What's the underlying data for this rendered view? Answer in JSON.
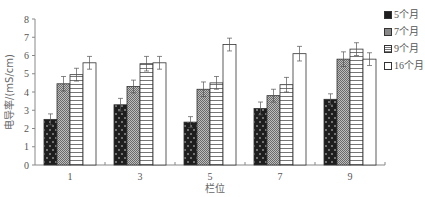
{
  "chart_data": {
    "type": "bar",
    "title": "",
    "xlabel": "栏位",
    "ylabel": "电导率/(mS/cm)",
    "categories": [
      "1",
      "3",
      "5",
      "7",
      "9"
    ],
    "ylim": [
      0,
      8
    ],
    "yticks": [
      0,
      1,
      2,
      3,
      4,
      5,
      6,
      7,
      8
    ],
    "grid": false,
    "legend_position": "top-right",
    "error_bars": true,
    "series": [
      {
        "name": "5个月",
        "pattern": "dark-dotted",
        "values": [
          2.5,
          3.3,
          2.35,
          3.1,
          3.6
        ],
        "errors": [
          0.3,
          0.35,
          0.3,
          0.35,
          0.3
        ]
      },
      {
        "name": "7个月",
        "pattern": "gray-checkered",
        "values": [
          4.45,
          4.3,
          4.15,
          3.8,
          5.8
        ],
        "errors": [
          0.4,
          0.35,
          0.4,
          0.35,
          0.4
        ]
      },
      {
        "name": "9个月",
        "pattern": "horizontal-stripes",
        "values": [
          4.95,
          5.55,
          4.5,
          4.4,
          6.35
        ],
        "errors": [
          0.35,
          0.4,
          0.35,
          0.4,
          0.35
        ]
      },
      {
        "name": "16个月",
        "pattern": "white",
        "values": [
          5.6,
          5.6,
          6.6,
          6.1,
          5.8
        ],
        "errors": [
          0.35,
          0.35,
          0.35,
          0.4,
          0.35
        ]
      }
    ]
  },
  "legend": {
    "items": [
      "5个月",
      "7个月",
      "9个月",
      "16个月"
    ]
  },
  "axes": {
    "x_label": "栏位",
    "y_label": "电导率/(mS/cm)"
  }
}
